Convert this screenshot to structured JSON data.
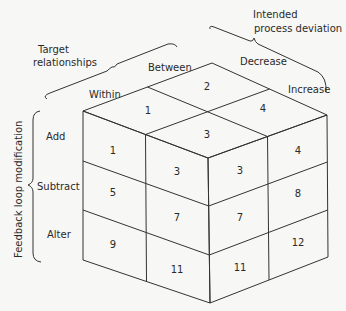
{
  "axes": {
    "target_relationships": {
      "title_line1": "Target",
      "title_line2": "relationships",
      "levels": [
        "Within",
        "Between"
      ]
    },
    "intended_process_deviation": {
      "title_line1": "Intended",
      "title_line2": "process  deviation",
      "levels": [
        "Decrease",
        "Increase"
      ]
    },
    "feedback_loop_modification": {
      "title": "Feedback  loop  modification",
      "levels": [
        "Add",
        "Subtract",
        "Alter"
      ]
    }
  },
  "cells": {
    "top": [
      "1",
      "2",
      "3",
      "4"
    ],
    "left": [
      "1",
      "3",
      "5",
      "7",
      "9",
      "11"
    ],
    "right": [
      "3",
      "4",
      "7",
      "8",
      "11",
      "12"
    ]
  },
  "colors": {
    "line": "#333333",
    "background": "#f7f7f5"
  }
}
